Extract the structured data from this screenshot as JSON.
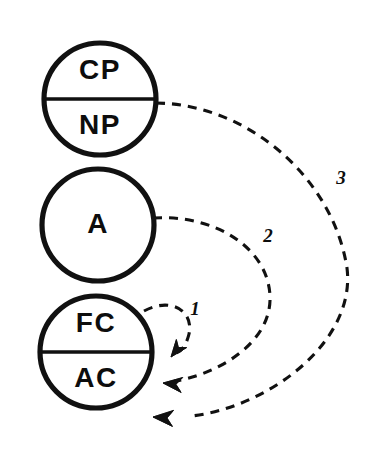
{
  "diagram": {
    "background_color": "#ffffff",
    "ink_color": "#111111",
    "ego_states": [
      {
        "id": "parent",
        "name": "parent-circle",
        "cx": 100,
        "cy": 99,
        "r": 56,
        "divided": true,
        "top_label": "CP",
        "bottom_label": "NP"
      },
      {
        "id": "adult",
        "name": "adult-circle",
        "cx": 98,
        "cy": 225,
        "r": 56,
        "divided": false,
        "center_label": "A"
      },
      {
        "id": "child",
        "name": "child-circle",
        "cx": 96,
        "cy": 352,
        "r": 56,
        "divided": true,
        "top_label": "FC",
        "bottom_label": "AC"
      }
    ],
    "transactions": [
      {
        "id": "t1",
        "label": "1",
        "label_x": 195,
        "label_y": 311,
        "from": "child-FC",
        "to": "child-AC",
        "path": "M 144 311 C 172 296, 194 312, 189 334 C 185 350, 179 352, 174 354",
        "arrow_x": 171,
        "arrow_y": 357,
        "arrow_angle": 128
      },
      {
        "id": "t2",
        "label": "2",
        "label_x": 268,
        "label_y": 238,
        "from": "adult-A",
        "to": "child-AC",
        "path": "M 153 218 C 215 214, 268 248, 270 296 C 272 344, 215 376, 170 382",
        "arrow_x": 163,
        "arrow_y": 383,
        "arrow_angle": 186
      },
      {
        "id": "t3",
        "label": "3",
        "label_x": 341,
        "label_y": 180,
        "from": "parent-divider",
        "to": "child-AC",
        "path": "M 156 103 C 248 104, 333 178, 347 268 C 356 340, 272 406, 192 416",
        "arrow_x": 153,
        "arrow_y": 417,
        "arrow_angle": 184
      }
    ]
  }
}
